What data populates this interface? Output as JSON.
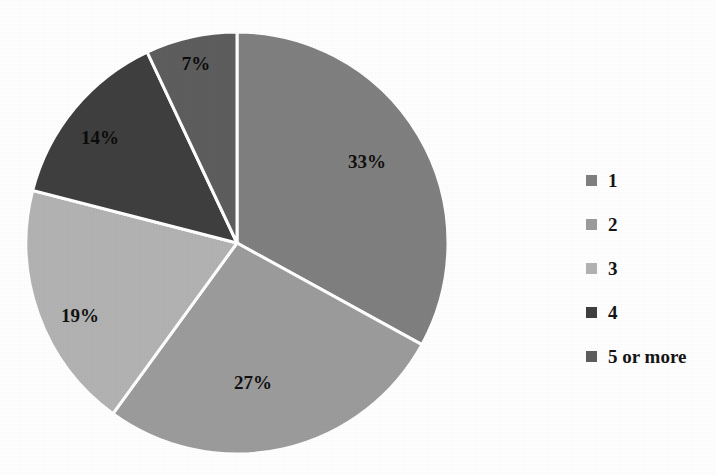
{
  "chart_data": {
    "type": "pie",
    "title": "",
    "subtitle": "",
    "xlabel": "",
    "ylabel": "",
    "grid": false,
    "legend_position": "right",
    "start_angle_deg": 0,
    "direction": "clockwise",
    "categories": [
      "1",
      "2",
      "3",
      "4",
      "5 or more"
    ],
    "values": [
      33,
      27,
      19,
      14,
      7
    ],
    "value_unit": "percent",
    "data_labels": [
      "33%",
      "27%",
      "19%",
      "14%",
      "7%"
    ],
    "slice_colors": [
      "#808080",
      "#9c9c9c",
      "#b3b3b3",
      "#3f3f3f",
      "#5e5e5e"
    ],
    "separator_color": "#ffffff",
    "background_color": "#ffffff",
    "label_color": "#111111",
    "slices": [
      {
        "category": "1",
        "value": 33,
        "label": "33%",
        "color": "#808080"
      },
      {
        "category": "2",
        "value": 27,
        "label": "27%",
        "color": "#9c9c9c"
      },
      {
        "category": "3",
        "value": 19,
        "label": "19%",
        "color": "#b3b3b3"
      },
      {
        "category": "4",
        "value": 14,
        "label": "14%",
        "color": "#3f3f3f"
      },
      {
        "category": "5 or more",
        "value": 7,
        "label": "7%",
        "color": "#5e5e5e"
      }
    ]
  },
  "labels": {
    "slice_1": "33%",
    "slice_2": "27%",
    "slice_3": "19%",
    "slice_4": "14%",
    "slice_5": "7%"
  },
  "legend": {
    "items": [
      {
        "label": "1",
        "color": "#808080"
      },
      {
        "label": "2",
        "color": "#9c9c9c"
      },
      {
        "label": "3",
        "color": "#b3b3b3"
      },
      {
        "label": "4",
        "color": "#3f3f3f"
      },
      {
        "label": "5 or more",
        "color": "#5e5e5e"
      }
    ]
  }
}
